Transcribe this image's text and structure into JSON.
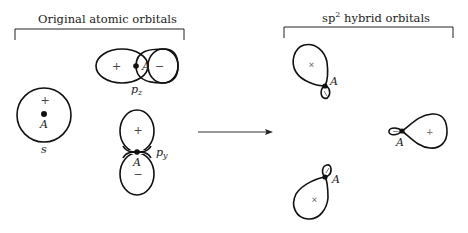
{
  "left_group": {
    "title": "Original atomic orbitals",
    "orbitals": {
      "s": {
        "label": "s",
        "nucleus": "A",
        "sign": "+"
      },
      "pz": {
        "label": "p",
        "subscript": "z",
        "nucleus": "A",
        "lobe_signs": [
          "+",
          "−"
        ]
      },
      "py": {
        "label": "p",
        "subscript": "y",
        "nucleus": "A",
        "lobe_signs": [
          "+",
          "−"
        ]
      }
    }
  },
  "arrow": {
    "direction": "right"
  },
  "right_group": {
    "title_base": "sp",
    "title_sup": "2",
    "title_rest": " hybrid orbitals",
    "orbitals": [
      {
        "name": "upper-left hybrid",
        "nucleus": "A",
        "sign": "+"
      },
      {
        "name": "right hybrid",
        "nucleus": "A",
        "sign": "+",
        "minor_sign": "−"
      },
      {
        "name": "lower hybrid",
        "nucleus": "A",
        "sign": "+"
      }
    ]
  },
  "colors": {
    "stroke": "#111111",
    "background": "#ffffff"
  }
}
